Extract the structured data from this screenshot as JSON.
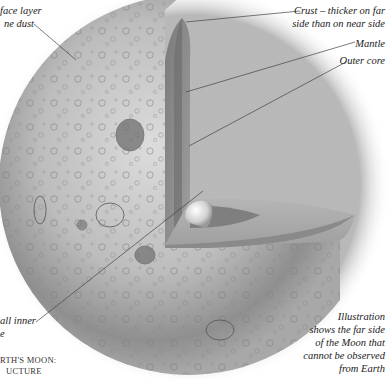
{
  "labels": {
    "surface": [
      "face layer",
      "ne dust"
    ],
    "crust": [
      "Crust – thicker on far",
      "side than on near side"
    ],
    "mantle": "Mantle",
    "outer_core": "Outer core",
    "inner_core": [
      "all inner",
      "e"
    ],
    "caption": [
      "RTH'S MOON:",
      "UCTURE"
    ],
    "note": [
      "Illustration",
      "shows the far side",
      "of the Moon that",
      "cannot be observed",
      "from Earth"
    ]
  },
  "colors": {
    "background": "#ffffff",
    "surface_light": "#d8d8d8",
    "surface_dark": "#8a8a8a",
    "cut_face": "#9a9a9a",
    "mantle_band": "#6e6e6e",
    "core": "#e8e8e8",
    "leader_line": "#444444"
  }
}
